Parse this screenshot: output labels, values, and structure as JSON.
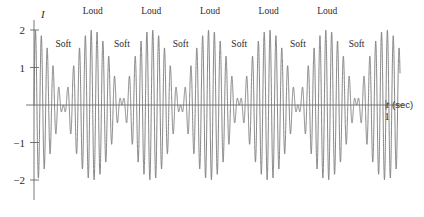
{
  "chart_data": {
    "type": "line",
    "title": "",
    "xlabel": "t (sec)",
    "ylabel": "I",
    "xlim": [
      0,
      1.04
    ],
    "ylim": [
      -2.15,
      2.15
    ],
    "grid": false,
    "legend_position": "none",
    "envelope": {
      "peak_amplitude": 2,
      "beat_cycles": 6,
      "formula": "I = 2 cos(6 pi t) sin(120 pi t)"
    },
    "carrier": {
      "cycles_per_second": 60
    },
    "x_ticks": [
      {
        "value": 1,
        "label": "1"
      }
    ],
    "y_ticks": [
      {
        "value": 2,
        "label": "2"
      },
      {
        "value": 1,
        "label": "1"
      },
      {
        "value": -1,
        "label": "−1"
      },
      {
        "value": -2,
        "label": "−2"
      }
    ],
    "annotations": [
      {
        "text": "Loud",
        "t": 0.1667,
        "y": 2.42
      },
      {
        "text": "Loud",
        "t": 0.3333,
        "y": 2.42
      },
      {
        "text": "Loud",
        "t": 0.5,
        "y": 2.42
      },
      {
        "text": "Loud",
        "t": 0.6667,
        "y": 2.42
      },
      {
        "text": "Loud",
        "t": 0.8333,
        "y": 2.42
      },
      {
        "text": "Soft",
        "t": 0.0833,
        "y": 1.55
      },
      {
        "text": "Soft",
        "t": 0.25,
        "y": 1.55
      },
      {
        "text": "Soft",
        "t": 0.4167,
        "y": 1.55
      },
      {
        "text": "Soft",
        "t": 0.5833,
        "y": 1.55
      },
      {
        "text": "Soft",
        "t": 0.75,
        "y": 1.55
      },
      {
        "text": "Soft",
        "t": 0.9167,
        "y": 1.55
      }
    ],
    "colors": {
      "curve": "#6e6e6e",
      "axis": "#555555",
      "text": "#2b2b2b",
      "background": "#ffffff"
    }
  },
  "axes": {
    "y_axis_name": "I",
    "x_axis_name": "t",
    "x_axis_unit": "(sec)"
  }
}
